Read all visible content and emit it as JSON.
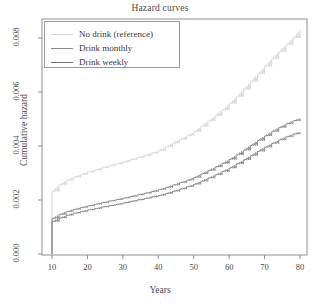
{
  "chart_data": {
    "type": "line",
    "title": "Hazard curves",
    "xlabel": "Years",
    "ylabel": "Cumulative hazard",
    "xlim": [
      7.5,
      82.5
    ],
    "ylim": [
      0.0,
      0.0087
    ],
    "grid": false,
    "legend_position": "top-left",
    "xticks": [
      "10",
      "20",
      "30",
      "40",
      "50",
      "60",
      "70",
      "80"
    ],
    "xtick_values": [
      10,
      20,
      30,
      40,
      50,
      60,
      70,
      80
    ],
    "yticks": [
      "0.000",
      "0.002",
      "0.004",
      "0.006",
      "0.008"
    ],
    "ytick_values": [
      0.0,
      0.002,
      0.004,
      0.006,
      0.008
    ],
    "x": [
      10,
      12,
      14,
      16,
      18,
      20,
      22,
      24,
      26,
      28,
      30,
      32,
      34,
      36,
      38,
      40,
      42,
      44,
      46,
      48,
      50,
      52,
      54,
      56,
      58,
      60,
      62,
      64,
      66,
      68,
      70,
      72,
      74,
      76,
      78,
      80
    ],
    "series": [
      {
        "name": "No drink (reference)",
        "color": "#d8d8d8",
        "values": [
          0.00232,
          0.00256,
          0.00272,
          0.00284,
          0.00294,
          0.00303,
          0.00311,
          0.00319,
          0.00327,
          0.00334,
          0.00341,
          0.00349,
          0.00357,
          0.00365,
          0.00373,
          0.00383,
          0.00396,
          0.0041,
          0.00424,
          0.00437,
          0.00452,
          0.00472,
          0.00492,
          0.00512,
          0.00533,
          0.00556,
          0.00582,
          0.00609,
          0.00638,
          0.00666,
          0.00694,
          0.00722,
          0.00749,
          0.00774,
          0.008,
          0.0083
        ]
      },
      {
        "name": "Drink monthly",
        "color": "#8a8a8a",
        "values": [
          0.00131,
          0.00146,
          0.00157,
          0.00165,
          0.00172,
          0.00178,
          0.00184,
          0.0019,
          0.00196,
          0.00201,
          0.00207,
          0.00213,
          0.00219,
          0.00225,
          0.00231,
          0.00238,
          0.00246,
          0.00255,
          0.00264,
          0.00273,
          0.00283,
          0.00296,
          0.00309,
          0.00322,
          0.00335,
          0.0035,
          0.00367,
          0.00384,
          0.00402,
          0.0042,
          0.00437,
          0.00453,
          0.00468,
          0.00482,
          0.00493,
          0.00503
        ]
      },
      {
        "name": "Drink weekly",
        "color": "#8a8a8a",
        "values": [
          0.0012,
          0.00133,
          0.00143,
          0.00151,
          0.00157,
          0.00163,
          0.00168,
          0.00174,
          0.00179,
          0.00184,
          0.00189,
          0.00195,
          0.002,
          0.00206,
          0.00211,
          0.00217,
          0.00224,
          0.00232,
          0.0024,
          0.00249,
          0.00258,
          0.00269,
          0.00281,
          0.00293,
          0.00305,
          0.00318,
          0.00333,
          0.00348,
          0.00364,
          0.0038,
          0.00395,
          0.00409,
          0.00422,
          0.00434,
          0.00444,
          0.00452
        ]
      }
    ]
  },
  "legend": {
    "entries": [
      {
        "label": "No drink (reference)",
        "color": "#d8d8d8"
      },
      {
        "label": "Drink monthly",
        "color": "#8a8a8a"
      },
      {
        "label": "Drink weekly",
        "color": "#6e6e6e"
      }
    ]
  },
  "axes": {
    "frame_color": "#8f8f8f"
  }
}
